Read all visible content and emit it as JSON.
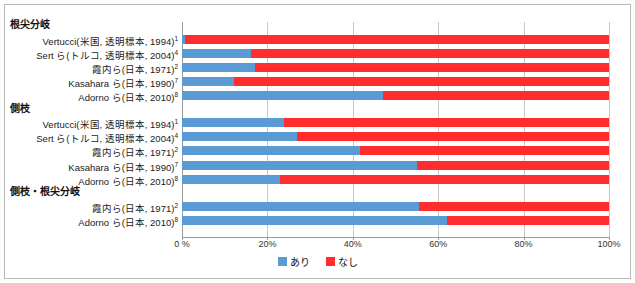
{
  "chart_data": {
    "type": "bar",
    "orientation": "horizontal",
    "stacked": true,
    "stack_mode": "percent",
    "title": "",
    "xlabel": "",
    "ylabel": "",
    "xlim": [
      0,
      100
    ],
    "xticks": [
      "0 %",
      "20%",
      "40%",
      "60%",
      "80%",
      "100%"
    ],
    "xtick_values": [
      0,
      20,
      40,
      60,
      80,
      100
    ],
    "grid": true,
    "legend_position": "bottom-center",
    "series": [
      {
        "name": "あり",
        "color": "#5b9bd5"
      },
      {
        "name": "なし",
        "color": "#ff2d2d"
      }
    ],
    "groups": [
      {
        "label": "根尖分岐",
        "rows": [
          {
            "category": "Vertucci(米国, 透明標本, 1994)",
            "ref": "1",
            "ari": 0.8,
            "nashi": 99.2
          },
          {
            "category": "Sert ら(トルコ, 透明標本, 2004)",
            "ref": "4",
            "ari": 16.2,
            "nashi": 83.8
          },
          {
            "category": "霞内ら(日本, 1971)",
            "ref": "2",
            "ari": 17.1,
            "nashi": 82.9
          },
          {
            "category": "Kasahara ら(日本, 1990)",
            "ref": "7",
            "ari": 12.2,
            "nashi": 87.8
          },
          {
            "category": "Adorno ら(日本, 2010)",
            "ref": "8",
            "ari": 47.0,
            "nashi": 53.0
          }
        ]
      },
      {
        "label": "側枝",
        "rows": [
          {
            "category": "Vertucci(米国, 透明標本, 1994)",
            "ref": "1",
            "ari": 23.9,
            "nashi": 76.1
          },
          {
            "category": "Sert ら(トルコ, 透明標本, 2004)",
            "ref": "4",
            "ari": 26.9,
            "nashi": 73.1
          },
          {
            "category": "霞内ら(日本, 1971)",
            "ref": "2",
            "ari": 41.7,
            "nashi": 58.3
          },
          {
            "category": "Kasahara ら(日本, 1990)",
            "ref": "7",
            "ari": 55.0,
            "nashi": 45.0
          },
          {
            "category": "Adorno ら(日本, 2010)",
            "ref": "8",
            "ari": 23.0,
            "nashi": 77.0
          }
        ]
      },
      {
        "label": "側枝・根尖分岐",
        "rows": [
          {
            "category": "霞内ら(日本, 1971)",
            "ref": "2",
            "ari": 55.5,
            "nashi": 44.5
          },
          {
            "category": "Adorno ら(日本, 2010)",
            "ref": "8",
            "ari": 62.0,
            "nashi": 38.0
          }
        ]
      }
    ]
  },
  "legend": {
    "items": [
      {
        "label": "あり",
        "color": "#5b9bd5"
      },
      {
        "label": "なし",
        "color": "#ff2d2d"
      }
    ]
  }
}
